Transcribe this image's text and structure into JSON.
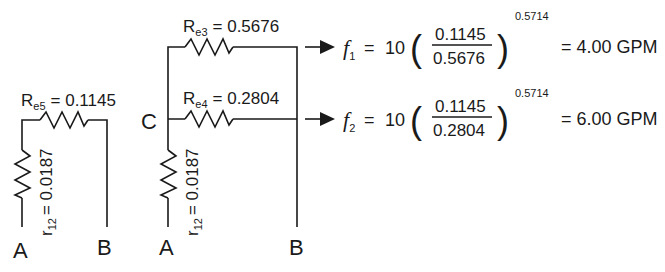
{
  "diagram": {
    "left_circuit": {
      "top_resistor": {
        "name": "R",
        "subscript": "e5",
        "value": "= 0.1145"
      },
      "vertical_resistor": {
        "name": "r",
        "subscript": "12",
        "value": "= 0.0187"
      },
      "node_a": "A",
      "node_b": "B"
    },
    "right_circuit": {
      "node_c": "C",
      "top_resistor": {
        "name": "R",
        "subscript": "e3",
        "value": "= 0.5676"
      },
      "middle_resistor": {
        "name": "R",
        "subscript": "e4",
        "value": "= 0.2804"
      },
      "vertical_resistor": {
        "name": "r",
        "subscript": "12",
        "value": "= 0.0187"
      },
      "node_a": "A",
      "node_b": "B"
    },
    "equations": [
      {
        "var": "f",
        "subscript": "1",
        "equals": "=",
        "coefficient": "10",
        "numerator": "0.1145",
        "denominator": "0.5676",
        "exponent": "0.5714",
        "result": "= 4.00 GPM"
      },
      {
        "var": "f",
        "subscript": "2",
        "equals": "=",
        "coefficient": "10",
        "numerator": "0.1145",
        "denominator": "0.2804",
        "exponent": "0.5714",
        "result": "= 6.00 GPM"
      }
    ],
    "colors": {
      "ink": "#1a1a1a",
      "background": "#ffffff"
    }
  }
}
